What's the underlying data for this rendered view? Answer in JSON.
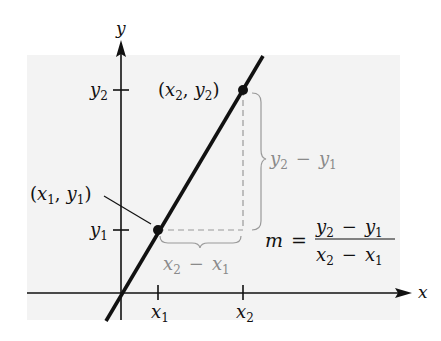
{
  "diagram": {
    "background_panel_color": "#f3f3f3",
    "axes": {
      "x_label": "x",
      "y_label": "y",
      "x_ticks": [
        {
          "base": "x",
          "sub": "1"
        },
        {
          "base": "x",
          "sub": "2"
        }
      ],
      "y_ticks": [
        {
          "base": "y",
          "sub": "1"
        },
        {
          "base": "y",
          "sub": "2"
        }
      ]
    },
    "points": [
      {
        "label_open": "(",
        "x_base": "x",
        "x_sub": "1",
        "comma": ",",
        "y_base": "y",
        "y_sub": "1",
        "label_close": ")"
      },
      {
        "label_open": "(",
        "x_base": "x",
        "x_sub": "2",
        "comma": ",",
        "y_base": "y",
        "y_sub": "2",
        "label_close": ")"
      }
    ],
    "rise_label": {
      "a": "y",
      "a_sub": "2",
      "op": "−",
      "b": "y",
      "b_sub": "1"
    },
    "run_label": {
      "a": "x",
      "a_sub": "2",
      "op": "−",
      "b": "x",
      "b_sub": "1"
    },
    "formula": {
      "lhs": "m",
      "eq": "=",
      "numerator": {
        "a": "y",
        "a_sub": "2",
        "op": "−",
        "b": "y",
        "b_sub": "1"
      },
      "denominator": {
        "a": "x",
        "a_sub": "2",
        "op": "−",
        "b": "x",
        "b_sub": "1"
      }
    },
    "colors": {
      "line": "#111111",
      "guide": "#9a9a9a",
      "panel": "#f3f3f3"
    }
  }
}
